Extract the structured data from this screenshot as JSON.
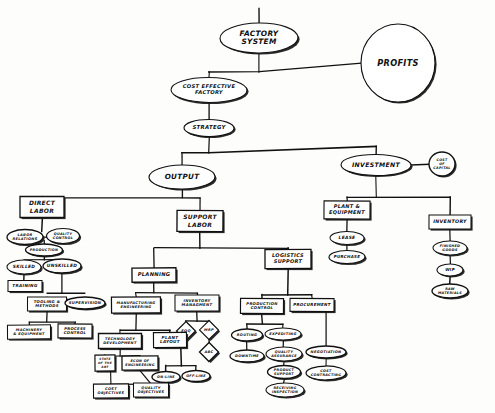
{
  "diagram": {
    "style": {
      "ink": "#111111",
      "paper": "#fdfdfc",
      "shadow": "#1a1a1a"
    },
    "nodes": [
      {
        "id": "factory_system",
        "label": "FACTORY\nSYSTEM",
        "shape": "ellipse",
        "x": 259,
        "y": 38,
        "w": 78,
        "h": 30,
        "fs": 7.4
      },
      {
        "id": "profits",
        "label": "PROFITS",
        "shape": "ellipse",
        "x": 398,
        "y": 63,
        "w": 74,
        "h": 78,
        "fs": 8.2
      },
      {
        "id": "cost_effective_factory",
        "label": "COST EFFECTIVE\nFACTORY",
        "shape": "ellipse",
        "x": 209,
        "y": 90,
        "w": 76,
        "h": 25,
        "fs": 5.2
      },
      {
        "id": "strategy",
        "label": "STRATEGY",
        "shape": "ellipse",
        "x": 209,
        "y": 128,
        "w": 50,
        "h": 17,
        "fs": 5.4
      },
      {
        "id": "output",
        "label": "OUTPUT",
        "shape": "ellipse",
        "x": 182,
        "y": 177,
        "w": 66,
        "h": 24,
        "fs": 7.2
      },
      {
        "id": "investment",
        "label": "INVESTMENT",
        "shape": "ellipse",
        "x": 376,
        "y": 165,
        "w": 70,
        "h": 21,
        "fs": 6.2
      },
      {
        "id": "cost_of_capital",
        "label": "COST\nOF\nCAPITAL",
        "shape": "ellipse",
        "x": 442,
        "y": 164,
        "w": 26,
        "h": 24,
        "fs": 3.3
      },
      {
        "id": "direct_labor",
        "label": "DIRECT\nLABOR",
        "shape": "rect",
        "x": 42,
        "y": 207,
        "w": 44,
        "h": 21,
        "fs": 6.0
      },
      {
        "id": "labor_relations",
        "label": "LABOR\nRELATIONS",
        "shape": "ellipse",
        "x": 25,
        "y": 237,
        "w": 36,
        "h": 15,
        "fs": 3.6
      },
      {
        "id": "quality_control_dl",
        "label": "QUALITY\nCONTROL",
        "shape": "ellipse",
        "x": 63,
        "y": 236,
        "w": 33,
        "h": 15,
        "fs": 3.4
      },
      {
        "id": "production_dl",
        "label": "PRODUCTION",
        "shape": "ellipse",
        "x": 44,
        "y": 250,
        "w": 37,
        "h": 12,
        "fs": 3.4
      },
      {
        "id": "skilled",
        "label": "SKILLED",
        "shape": "ellipse",
        "x": 24,
        "y": 267,
        "w": 34,
        "h": 14,
        "fs": 4.4
      },
      {
        "id": "unskilled",
        "label": "UNSKILLED",
        "shape": "ellipse",
        "x": 62,
        "y": 266,
        "w": 38,
        "h": 14,
        "fs": 4.4
      },
      {
        "id": "training",
        "label": "TRAINING",
        "shape": "rect",
        "x": 25,
        "y": 286,
        "w": 34,
        "h": 11,
        "fs": 4.2
      },
      {
        "id": "tooling_methods",
        "label": "TOOLING &\nMETHODS",
        "shape": "rect",
        "x": 47,
        "y": 304,
        "w": 39,
        "h": 14,
        "fs": 3.8
      },
      {
        "id": "supervision",
        "label": "SUPERVISION",
        "shape": "ellipse",
        "x": 85,
        "y": 303,
        "w": 40,
        "h": 12,
        "fs": 3.8
      },
      {
        "id": "machinery_equipment",
        "label": "MACHINERY\n& EQUIPMENT",
        "shape": "rect",
        "x": 29,
        "y": 332,
        "w": 43,
        "h": 14,
        "fs": 3.6
      },
      {
        "id": "process_control",
        "label": "PROCESS\nCONTROL",
        "shape": "rect",
        "x": 75,
        "y": 331,
        "w": 34,
        "h": 14,
        "fs": 3.8
      },
      {
        "id": "support_labor",
        "label": "SUPPORT\nLABOR",
        "shape": "rect",
        "x": 200,
        "y": 221,
        "w": 46,
        "h": 21,
        "fs": 6.0
      },
      {
        "id": "planning",
        "label": "PLANNING",
        "shape": "rect",
        "x": 154,
        "y": 275,
        "w": 44,
        "h": 14,
        "fs": 5.2
      },
      {
        "id": "logistics_support",
        "label": "LOGISTICS\nSUPPORT",
        "shape": "rect",
        "x": 288,
        "y": 259,
        "w": 46,
        "h": 19,
        "fs": 5.0
      },
      {
        "id": "mfg_engineering",
        "label": "MANUFACTURING\nENGINEERING",
        "shape": "rect",
        "x": 136,
        "y": 305,
        "w": 49,
        "h": 16,
        "fs": 3.6
      },
      {
        "id": "inventory_mgmt",
        "label": "INVENTORY\nMANAGMENT",
        "shape": "rect",
        "x": 197,
        "y": 303,
        "w": 44,
        "h": 16,
        "fs": 3.8
      },
      {
        "id": "eoq",
        "label": "EOQ",
        "shape": "diamond",
        "x": 186,
        "y": 331,
        "w": 19,
        "h": 19,
        "fs": 3.6
      },
      {
        "id": "mrp",
        "label": "MRP",
        "shape": "diamond",
        "x": 209,
        "y": 330,
        "w": 19,
        "h": 19,
        "fs": 3.6
      },
      {
        "id": "abc",
        "label": "ABC",
        "shape": "diamond",
        "x": 209,
        "y": 352,
        "w": 19,
        "h": 19,
        "fs": 3.6
      },
      {
        "id": "technology_dev",
        "label": "TECHNOLOGY\nDEVELOPMENT",
        "shape": "rect",
        "x": 120,
        "y": 341,
        "w": 43,
        "h": 15,
        "fs": 3.6
      },
      {
        "id": "plant_layout",
        "label": "PLANT\nLAYOUT",
        "shape": "rect",
        "x": 170,
        "y": 340,
        "w": 33,
        "h": 15,
        "fs": 4.2
      },
      {
        "id": "state_of_the_art",
        "label": "STATE\nOF THE\nART",
        "shape": "rect",
        "x": 105,
        "y": 363,
        "w": 20,
        "h": 16,
        "fs": 3.0
      },
      {
        "id": "econ_of_engineering",
        "label": "ECON OF\nENGINEERING",
        "shape": "rect",
        "x": 140,
        "y": 363,
        "w": 36,
        "h": 14,
        "fs": 3.4
      },
      {
        "id": "on_line",
        "label": "ON-LINE",
        "shape": "ellipse",
        "x": 166,
        "y": 377,
        "w": 28,
        "h": 11,
        "fs": 3.4
      },
      {
        "id": "off_line",
        "label": "OFF-LINE",
        "shape": "ellipse",
        "x": 196,
        "y": 376,
        "w": 28,
        "h": 11,
        "fs": 3.4
      },
      {
        "id": "cost_objectives",
        "label": "COST\nOBJECTIVES",
        "shape": "rect",
        "x": 111,
        "y": 391,
        "w": 35,
        "h": 14,
        "fs": 3.6
      },
      {
        "id": "quality_objectives",
        "label": "QUALITY\nOBJECTIVES",
        "shape": "rect",
        "x": 151,
        "y": 390,
        "w": 35,
        "h": 14,
        "fs": 3.6
      },
      {
        "id": "production_control",
        "label": "PRODUCTION\nCONTROL",
        "shape": "rect",
        "x": 262,
        "y": 306,
        "w": 43,
        "h": 15,
        "fs": 3.8
      },
      {
        "id": "procurement",
        "label": "PROCUREMENT",
        "shape": "rect",
        "x": 312,
        "y": 305,
        "w": 44,
        "h": 13,
        "fs": 4.0
      },
      {
        "id": "routing",
        "label": "ROUTING",
        "shape": "ellipse",
        "x": 247,
        "y": 335,
        "w": 31,
        "h": 12,
        "fs": 3.6
      },
      {
        "id": "expediting",
        "label": "EXPEDITING",
        "shape": "ellipse",
        "x": 283,
        "y": 334,
        "w": 36,
        "h": 12,
        "fs": 3.6
      },
      {
        "id": "downtime",
        "label": "DOWNTIME",
        "shape": "ellipse",
        "x": 247,
        "y": 356,
        "w": 34,
        "h": 12,
        "fs": 3.4
      },
      {
        "id": "quality_assurance",
        "label": "QUALITY\nASSURANCE",
        "shape": "ellipse",
        "x": 284,
        "y": 354,
        "w": 36,
        "h": 14,
        "fs": 3.4
      },
      {
        "id": "product_support",
        "label": "PRODUCT\nSUPPORT",
        "shape": "ellipse",
        "x": 284,
        "y": 372,
        "w": 33,
        "h": 13,
        "fs": 3.4
      },
      {
        "id": "receiving_inspection",
        "label": "RECEIVING\nINSPECTION",
        "shape": "ellipse",
        "x": 285,
        "y": 390,
        "w": 38,
        "h": 14,
        "fs": 3.4
      },
      {
        "id": "negotiation",
        "label": "NEGOTIATION",
        "shape": "ellipse",
        "x": 326,
        "y": 352,
        "w": 40,
        "h": 12,
        "fs": 3.6
      },
      {
        "id": "cost_contracting",
        "label": "COST\nCONTRACTING",
        "shape": "ellipse",
        "x": 326,
        "y": 373,
        "w": 40,
        "h": 14,
        "fs": 3.4
      },
      {
        "id": "plant_equipment",
        "label": "PLANT &\nEQUIPMENT",
        "shape": "rect",
        "x": 347,
        "y": 210,
        "w": 46,
        "h": 18,
        "fs": 5.0
      },
      {
        "id": "lease",
        "label": "LEASE",
        "shape": "ellipse",
        "x": 347,
        "y": 238,
        "w": 34,
        "h": 13,
        "fs": 4.4
      },
      {
        "id": "purchase",
        "label": "PURCHASE",
        "shape": "ellipse",
        "x": 347,
        "y": 257,
        "w": 36,
        "h": 13,
        "fs": 4.0
      },
      {
        "id": "inventory",
        "label": "INVENTORY",
        "shape": "rect",
        "x": 450,
        "y": 222,
        "w": 42,
        "h": 14,
        "fs": 4.8
      },
      {
        "id": "finished_goods",
        "label": "FINISHED\nGOODS",
        "shape": "ellipse",
        "x": 450,
        "y": 248,
        "w": 34,
        "h": 14,
        "fs": 3.4
      },
      {
        "id": "wip",
        "label": "WIP",
        "shape": "ellipse",
        "x": 450,
        "y": 270,
        "w": 26,
        "h": 12,
        "fs": 4.0
      },
      {
        "id": "raw_materials",
        "label": "RAW\nMATERIALS",
        "shape": "ellipse",
        "x": 450,
        "y": 291,
        "w": 36,
        "h": 14,
        "fs": 3.4
      }
    ],
    "edges": [
      {
        "from": "top_stem",
        "points": "259,8 259,23"
      },
      {
        "from": "factory_system",
        "points": "259,53 259,72"
      },
      {
        "from": "fs_to_profits",
        "points": "209,72 259,72 361,63"
      },
      {
        "from": "fs_bus",
        "points": "209,72 209,78"
      },
      {
        "from": "cef_to_strategy",
        "points": "209,103 209,120"
      },
      {
        "from": "strategy_down",
        "points": "209,137 209,153"
      },
      {
        "from": "strategy_bus",
        "points": "182,153 209,153 376,146"
      },
      {
        "from": "bus_to_output",
        "points": "182,153 182,165"
      },
      {
        "from": "bus_to_investment",
        "points": "376,146 376,155"
      },
      {
        "from": "investment_cap",
        "points": "411,165 429,164"
      },
      {
        "from": "output_down",
        "points": "182,189 182,198"
      },
      {
        "from": "output_bus",
        "points": "42,198 182,198 200,198"
      },
      {
        "from": "bus_direct_labor",
        "points": "42,198 42,197"
      },
      {
        "from": "bus_support_labor",
        "points": "200,198 200,211"
      },
      {
        "from": "dl_down",
        "points": "42,218 42,232"
      },
      {
        "from": "dl_bus1",
        "points": "25,237 63,237"
      },
      {
        "from": "dl_to_prod",
        "points": "44,241 44,244"
      },
      {
        "from": "prod_down",
        "points": "44,256 44,260"
      },
      {
        "from": "prod_bus",
        "points": "24,260 62,260"
      },
      {
        "from": "skilled_down",
        "points": "24,274 24,281"
      },
      {
        "from": "unskilled_down",
        "points": "62,273 62,293"
      },
      {
        "from": "unsk_bus",
        "points": "47,293 85,293"
      },
      {
        "from": "tool_down",
        "points": "47,297 47,311"
      },
      {
        "from": "sup_down",
        "points": "85,297 85,303"
      },
      {
        "from": "tool_bus",
        "points": "29,322 75,322"
      },
      {
        "from": "tool_stem",
        "points": "47,311 47,322"
      },
      {
        "from": "mach_down",
        "points": "29,322 29,325"
      },
      {
        "from": "proc_down",
        "points": "75,322 75,324"
      },
      {
        "from": "sl_down",
        "points": "200,232 200,248"
      },
      {
        "from": "sl_bus",
        "points": "154,248 288,248"
      },
      {
        "from": "planning_stem",
        "points": "154,248 154,268"
      },
      {
        "from": "logistics_stem",
        "points": "288,248 288,250"
      },
      {
        "from": "planning_down",
        "points": "154,282 154,293"
      },
      {
        "from": "planning_bus",
        "points": "136,293 197,293"
      },
      {
        "from": "mfge_stem",
        "points": "136,293 136,297"
      },
      {
        "from": "invm_stem",
        "points": "197,293 197,295"
      },
      {
        "from": "invm_down",
        "points": "197,311 197,321"
      },
      {
        "from": "invm_bus",
        "points": "186,321 209,321"
      },
      {
        "from": "eoq_stem",
        "points": "186,321 186,322"
      },
      {
        "from": "mrp_stem",
        "points": "209,321 209,321"
      },
      {
        "from": "mrp_to_abc",
        "points": "209,340 209,343"
      },
      {
        "from": "mfge_down",
        "points": "136,313 136,330"
      },
      {
        "from": "mfge_bus",
        "points": "120,330 170,330"
      },
      {
        "from": "tech_stem",
        "points": "120,330 120,334"
      },
      {
        "from": "pl_stem",
        "points": "170,330 170,333"
      },
      {
        "from": "tech_down",
        "points": "120,349 120,356"
      },
      {
        "from": "tech_bus",
        "points": "105,356 140,356"
      },
      {
        "from": "soa_stem",
        "points": "105,356 105,355"
      },
      {
        "from": "econ_stem",
        "points": "140,356 140,356"
      },
      {
        "from": "soa_down",
        "points": "111,371 111,384"
      },
      {
        "from": "econ_down",
        "points": "140,370 151,384"
      },
      {
        "from": "bottom_bus",
        "points": "111,384 151,384"
      },
      {
        "from": "pl_down",
        "points": "181,348 181,366"
      },
      {
        "from": "pl_bus",
        "points": "166,366 196,366"
      },
      {
        "from": "onl_stem",
        "points": "166,366 166,372"
      },
      {
        "from": "offl_stem",
        "points": "196,366 196,371"
      },
      {
        "from": "log_down",
        "points": "288,269 288,295"
      },
      {
        "from": "log_bus",
        "points": "262,295 312,295"
      },
      {
        "from": "pc_stem",
        "points": "262,295 262,299"
      },
      {
        "from": "proc_stem2",
        "points": "312,295 312,299"
      },
      {
        "from": "pc_down",
        "points": "262,314 262,324"
      },
      {
        "from": "pc_bus",
        "points": "247,324 283,324"
      },
      {
        "from": "rout_stem",
        "points": "247,324 247,329"
      },
      {
        "from": "exp_stem",
        "points": "283,324 283,328"
      },
      {
        "from": "rout_down",
        "points": "247,341 247,350"
      },
      {
        "from": "exp_down",
        "points": "283,340 283,347"
      },
      {
        "from": "qa_down",
        "points": "284,361 284,366"
      },
      {
        "from": "ps_down",
        "points": "284,379 284,383"
      },
      {
        "from": "procu_down",
        "points": "326,312 326,346"
      },
      {
        "from": "neg_down",
        "points": "326,358 326,366"
      },
      {
        "from": "inv_down",
        "points": "376,176 376,197"
      },
      {
        "from": "inv_bus",
        "points": "347,197 450,197"
      },
      {
        "from": "pe_stem",
        "points": "347,197 347,201"
      },
      {
        "from": "invn_stem",
        "points": "450,197 450,215"
      },
      {
        "from": "pe_down",
        "points": "347,219 347,232"
      },
      {
        "from": "lease_down",
        "points": "347,245 347,251"
      },
      {
        "from": "invn_down",
        "points": "450,229 450,241"
      },
      {
        "from": "fg_down",
        "points": "450,255 450,264"
      },
      {
        "from": "wip_down",
        "points": "450,276 450,284"
      }
    ]
  }
}
